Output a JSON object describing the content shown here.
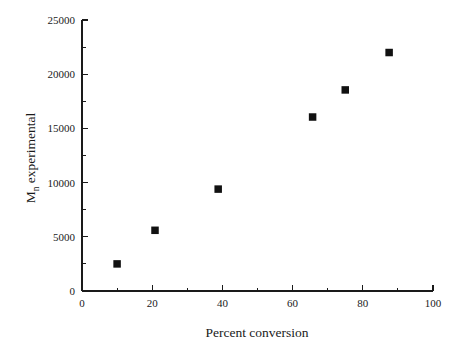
{
  "chart_data": {
    "type": "scatter",
    "title": "",
    "subtitle": "",
    "xlabel": "Percent conversion",
    "ylabel": "M_n experimental",
    "ylabel_main": "M",
    "ylabel_subscript": "n",
    "ylabel_rest": " experimental",
    "xlim": [
      0,
      100
    ],
    "ylim": [
      0,
      25000
    ],
    "grid": false,
    "legend": null,
    "legend_position": "none",
    "marker_style": "filled-square",
    "marker_color": "#111111",
    "background_color": "#ffffff",
    "axis_color": "#1a1a1a",
    "x_ticks_major": [
      0,
      20,
      40,
      60,
      80,
      100
    ],
    "x_ticks_major_labels": [
      "0",
      "20",
      "40",
      "60",
      "80",
      "100"
    ],
    "x_ticks_minor": [
      10,
      30,
      50,
      70,
      90
    ],
    "y_ticks_major": [
      0,
      5000,
      10000,
      15000,
      20000,
      25000
    ],
    "y_ticks_major_labels": [
      "0",
      "5000",
      "10000",
      "15000",
      "20000",
      "25000"
    ],
    "y_ticks_minor": [
      2500,
      7500,
      12500,
      17500,
      22500
    ],
    "series": [
      {
        "name": "Mn experimental",
        "points": [
          {
            "x": 10.0,
            "y": 2500
          },
          {
            "x": 20.8,
            "y": 5600
          },
          {
            "x": 38.8,
            "y": 9400
          },
          {
            "x": 65.7,
            "y": 16050
          },
          {
            "x": 75.0,
            "y": 18550
          },
          {
            "x": 87.5,
            "y": 22000
          }
        ]
      }
    ],
    "x": [
      10.0,
      20.8,
      38.8,
      65.7,
      75.0,
      87.5
    ],
    "values": [
      2500,
      5600,
      9400,
      16050,
      18550,
      22000
    ]
  },
  "figure": {
    "width": 463,
    "height": 354,
    "plot_left_px": 82,
    "plot_right_px": 433,
    "plot_top_px": 20,
    "plot_bottom_px": 291
  }
}
